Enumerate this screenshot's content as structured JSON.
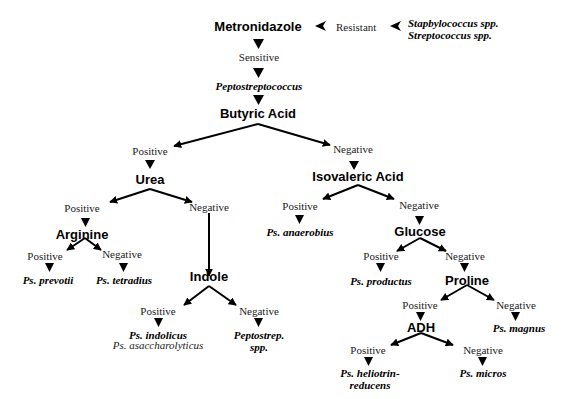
{
  "nodes": {
    "metronidazole": "Metronidazole",
    "resistant": "Resistant",
    "resistant_result_1": "Stapbylococcus spp.",
    "resistant_result_2": "Streptococcus spp.",
    "sensitive": "Sensitive",
    "peptostreptococcus": "Peptostreptococcus",
    "butyric_acid": "Butyric Acid",
    "butyric_positive": "Positive",
    "butyric_negative": "Negative",
    "urea": "Urea",
    "urea_positive": "Positive",
    "urea_negative": "Negative",
    "arginine": "Arginine",
    "arginine_positive": "Positive",
    "arginine_negative": "Negative",
    "ps_prevotii": "Ps. prevotii",
    "ps_tetradius": "Ps. tetradius",
    "indole": "Indole",
    "indole_positive": "Positive",
    "indole_negative": "Negative",
    "ps_indolicus": "Ps. indolicus",
    "ps_asaccharolyticus": "Ps. asaccharolyticus",
    "peptostrep_spp_1": "Peptostrep.",
    "peptostrep_spp_2": "spp.",
    "isovaleric_acid": "Isovaleric Acid",
    "isovaleric_positive": "Positive",
    "isovaleric_negative": "Negative",
    "ps_anaerobius": "Ps. anaerobius",
    "glucose": "Glucose",
    "glucose_positive": "Positive",
    "glucose_negative": "Negative",
    "ps_productus": "Ps. productus",
    "proline": "Proline",
    "proline_positive": "Positive",
    "proline_negative": "Negative",
    "ps_magnus": "Ps. magnus",
    "adh": "ADH",
    "adh_positive": "Positive",
    "adh_negative": "Negative",
    "ps_heliotrin_1": "Ps. heliotrin-",
    "ps_heliotrin_2": "reducens",
    "ps_micros": "Ps. micros"
  },
  "colors": {
    "ink": "#000000",
    "background": "#ffffff"
  }
}
